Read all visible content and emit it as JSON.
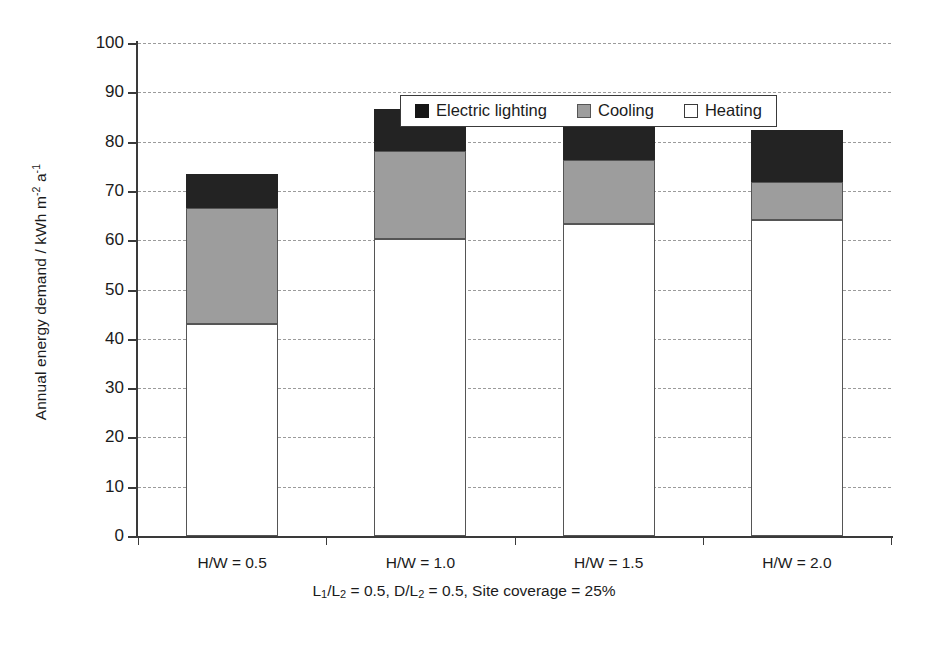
{
  "chart_data": {
    "type": "bar",
    "subtype": "stacked-vertical",
    "title": "",
    "xlabel": "L₁/L₂ = 0.5, D/L₂ = 0.5, Site coverage = 25%",
    "ylabel": "Annual energy demand / kWh m⁻² a⁻¹",
    "categories": [
      "H/W = 0.5",
      "H/W = 1.0",
      "H/W = 1.5",
      "H/W = 2.0"
    ],
    "series": [
      {
        "name": "Heating",
        "color": "#ffffff",
        "values": [
          43.0,
          60.3,
          63.2,
          64.0
        ]
      },
      {
        "name": "Cooling",
        "color": "#9d9d9d",
        "values": [
          23.5,
          17.7,
          13.0,
          7.8
        ]
      },
      {
        "name": "Electric lighting",
        "color": "#232323",
        "values": [
          7.0,
          8.6,
          9.3,
          10.6
        ]
      }
    ],
    "stack_totals": [
      73.5,
      86.6,
      85.5,
      82.4
    ],
    "ylim": [
      0,
      100
    ],
    "ytick_step": 10,
    "yticks": [
      0,
      10,
      20,
      30,
      40,
      50,
      60,
      70,
      80,
      90,
      100
    ],
    "ytick_labels": [
      "0",
      "10",
      "20",
      "30",
      "40",
      "50",
      "60",
      "70",
      "80",
      "90",
      "100"
    ],
    "grid": "horizontal-dashed",
    "legend_position": "top-center-inside",
    "legend_order": [
      "Electric lighting",
      "Cooling",
      "Heating"
    ]
  },
  "axis": {
    "y_title_main": "Annual energy demand / kWh m",
    "y_title_sup1": "-2",
    "y_title_mid": " a",
    "y_title_sup2": "-1"
  },
  "legend": {
    "items": [
      {
        "label": "Electric lighting",
        "swatch": "lighting-swatch"
      },
      {
        "label": "Cooling",
        "swatch": "cooling-swatch"
      },
      {
        "label": "Heating",
        "swatch": "heating-swatch"
      }
    ]
  },
  "xcaption": {
    "p1": "L",
    "s1": "1",
    "p2": "/L",
    "s2": "2",
    "p3": " = 0.5, D/L",
    "s3": "2",
    "p4": " = 0.5, Site coverage = 25%"
  }
}
